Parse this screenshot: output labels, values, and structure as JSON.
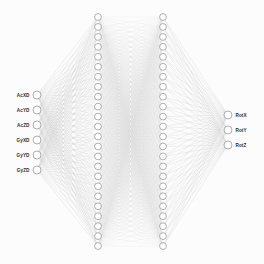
{
  "diagram": {
    "background_color": "#fcfcfc",
    "edge_color": "#8e8e8e",
    "node_fill": "#ffffff",
    "node_stroke": "#9a9a9a",
    "label_color": "#2b2b2b"
  },
  "chart_data": {
    "type": "diagram",
    "subtype": "neural-network-graph",
    "title": "",
    "layers": [
      {
        "name": "input",
        "node_count": 6,
        "x": 37,
        "y_start": 95,
        "y_step": 15,
        "radius": 4,
        "labels": [
          "AcXD",
          "AcYD",
          "AcZD",
          "GyXD",
          "GyYD",
          "GyZD"
        ],
        "label_side": "left"
      },
      {
        "name": "hidden-1",
        "node_count": 24,
        "x": 98,
        "y_start": 17,
        "y_step": 9.96,
        "radius": 3.4,
        "labels": [],
        "label_side": "none"
      },
      {
        "name": "hidden-2",
        "node_count": 24,
        "x": 163,
        "y_start": 17,
        "y_step": 9.96,
        "radius": 3.4,
        "labels": [],
        "label_side": "none"
      },
      {
        "name": "output",
        "node_count": 3,
        "x": 228,
        "y_start": 115,
        "y_step": 15,
        "radius": 4,
        "labels": [
          "RotX",
          "RotY",
          "RotZ"
        ],
        "label_side": "right"
      }
    ],
    "connections": [
      {
        "from": "input",
        "to": "hidden-1",
        "fully_connected": true,
        "stroke_width": 0.22,
        "opacity": 0.5
      },
      {
        "from": "hidden-1",
        "to": "hidden-2",
        "fully_connected": true,
        "stroke_width": 0.16,
        "opacity": 0.34
      },
      {
        "from": "hidden-2",
        "to": "output",
        "fully_connected": true,
        "stroke_width": 0.22,
        "opacity": 0.5
      }
    ],
    "input_labels": [
      "AcXD",
      "AcYD",
      "AcZD",
      "GyXD",
      "GyYD",
      "GyZD"
    ],
    "output_labels": [
      "RotX",
      "RotY",
      "RotZ"
    ],
    "architecture": [
      6,
      24,
      24,
      3
    ]
  }
}
